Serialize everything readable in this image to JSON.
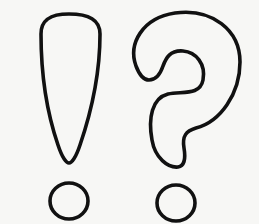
{
  "illustration": {
    "description": "Outlined exclamation mark and question mark",
    "symbols": [
      {
        "name": "exclamation-mark",
        "glyph": "!"
      },
      {
        "name": "question-mark",
        "glyph": "?"
      }
    ],
    "colors": {
      "background": "#f7f7f5",
      "stroke": "#111111"
    }
  }
}
